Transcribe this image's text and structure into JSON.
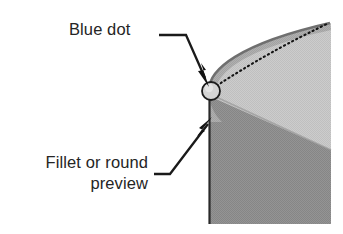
{
  "diagram": {
    "background_color": "#ffffff",
    "callouts": [
      {
        "id": "blue-dot",
        "text": "Blue dot",
        "lines": [
          "Blue dot"
        ],
        "align": "left",
        "leader": "horizontal-then-diagonal-down-right",
        "points_to": "blue-dot-handle"
      },
      {
        "id": "fillet-preview",
        "text": "Fillet or round preview",
        "lines": [
          "Fillet or round",
          "preview"
        ],
        "align": "right",
        "leader": "horizontal-then-diagonal-up-right",
        "points_to": "fillet-arc"
      }
    ],
    "graphic": {
      "name": "3d-model-corner-preview",
      "description": "Shaded 3D solid corner with a rounded (filleted) edge preview and a dotted original sharp edge",
      "faces": [
        {
          "name": "top-face-light",
          "color": "#c8c8c8"
        },
        {
          "name": "front-face-dark",
          "color": "#8e8e8e"
        },
        {
          "name": "fillet-band",
          "color": "#a8a8a8"
        }
      ],
      "edges": {
        "original_sharp_edge": {
          "style": "dotted",
          "color": "#1a1a1a"
        },
        "fillet_edge": {
          "style": "solid",
          "color": "#6b6b6b"
        },
        "left_silhouette": {
          "style": "solid",
          "color": "#2a2a2a"
        }
      },
      "handle": {
        "name": "blue-dot-handle",
        "shape": "circle",
        "fill_color": "#d2d2d2",
        "stroke_color": "#1c1c1c",
        "center_x": 211,
        "center_y": 91,
        "radius": 9
      }
    },
    "colors": {
      "text": "#252525",
      "leader_line": "#1a1a1a",
      "light_gray_face": "#c8c8c8",
      "dark_gray_face": "#8e8e8e",
      "mid_gray_fillet": "#a8a8a8"
    }
  }
}
